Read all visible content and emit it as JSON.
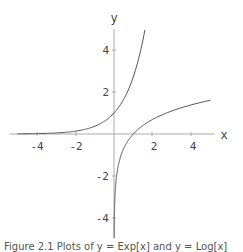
{
  "chart_data": {
    "type": "line",
    "title": "",
    "xlabel": "x",
    "ylabel": "y",
    "xlim": [
      -5.2,
      5.2
    ],
    "ylim": [
      -5,
      5
    ],
    "x_ticks": [
      -4,
      -2,
      2,
      4
    ],
    "y_ticks": [
      -4,
      -2,
      2,
      4
    ],
    "x_tick_labels": [
      "-4",
      "-2",
      "2",
      "4"
    ],
    "y_tick_labels": [
      "-4",
      "-2",
      "2",
      "4"
    ],
    "grid": false,
    "legend": null,
    "series": [
      {
        "name": "exp(x)",
        "x": [
          -5,
          -4,
          -3,
          -2,
          -1,
          0,
          0.5,
          1,
          1.25,
          1.5,
          1.6
        ],
        "y": [
          0.007,
          0.018,
          0.05,
          0.135,
          0.368,
          1,
          1.649,
          2.718,
          3.49,
          4.48,
          4.95
        ]
      },
      {
        "name": "log(x)",
        "x": [
          0.007,
          0.02,
          0.05,
          0.1,
          0.25,
          0.5,
          1,
          2,
          3,
          4,
          5
        ],
        "y": [
          -4.96,
          -3.91,
          -3.0,
          -2.3,
          -1.39,
          -0.69,
          0,
          0.69,
          1.1,
          1.39,
          1.61
        ]
      }
    ]
  },
  "axes": {
    "x_label": "x",
    "y_label": "y",
    "x_ticks": [
      "-4",
      "-2",
      "2",
      "4"
    ],
    "y_ticks": [
      "4",
      "2",
      "-2",
      "-4"
    ]
  },
  "caption": {
    "text": "Figure 2.1   Plots of y = Exp[x] and y = Log[x]"
  }
}
